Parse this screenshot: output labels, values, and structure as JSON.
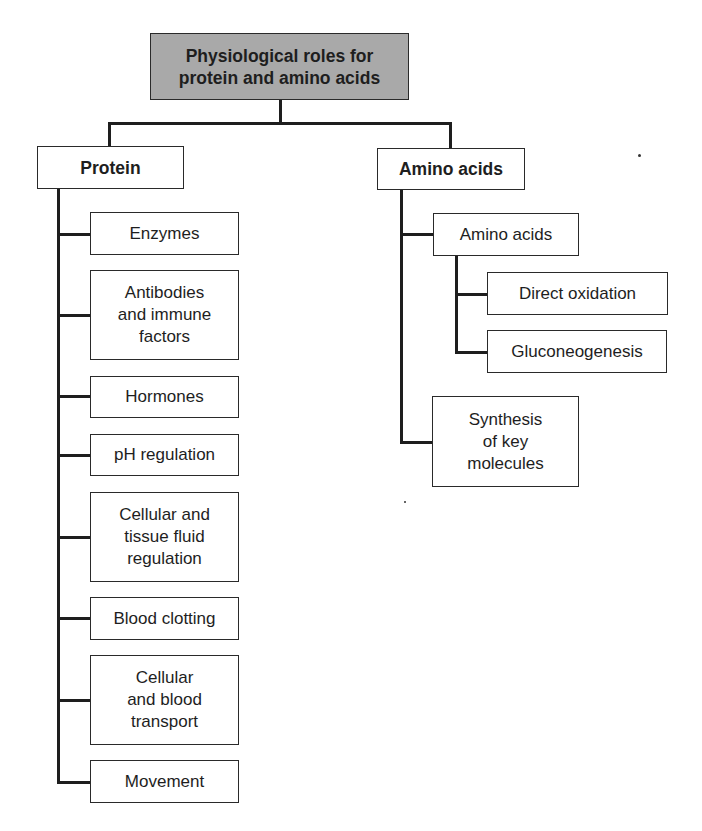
{
  "diagram": {
    "type": "hierarchy",
    "root": {
      "label": "Physiological roles for\nprotein and amino acids"
    },
    "branches": [
      {
        "label": "Protein",
        "children": [
          {
            "label": "Enzymes"
          },
          {
            "label": "Antibodies\nand immune\nfactors"
          },
          {
            "label": "Hormones"
          },
          {
            "label": "pH regulation"
          },
          {
            "label": "Cellular and\ntissue fluid\nregulation"
          },
          {
            "label": "Blood clotting"
          },
          {
            "label": "Cellular\nand blood\ntransport"
          },
          {
            "label": "Movement"
          }
        ]
      },
      {
        "label": "Amino acids",
        "children": [
          {
            "label": "Amino acids",
            "children": [
              {
                "label": "Direct oxidation"
              },
              {
                "label": "Gluconeogenesis"
              }
            ]
          },
          {
            "label": "Synthesis\nof key\nmolecules"
          }
        ]
      }
    ],
    "colors": {
      "root_fill": "#a9a9a9",
      "box_fill": "#ffffff",
      "line": "#1e1e1e"
    }
  }
}
